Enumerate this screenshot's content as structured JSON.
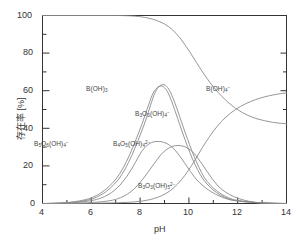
{
  "figure": {
    "name": "boron-speciation-diagram",
    "background_color": "#ffffff",
    "axis_color": "#333333",
    "curve_color": "#8a8a8a"
  },
  "axes": {
    "x_title": "pH",
    "y_title": "存在率 [%]",
    "x_ticks": [
      "4",
      "6",
      "8",
      "10",
      "12",
      "14"
    ],
    "y_ticks": [
      "0",
      "20",
      "40",
      "60",
      "80",
      "100"
    ],
    "x_minor_count": 1,
    "y_minor_count": 1
  },
  "species_labels": [
    {
      "id": "boric-acid",
      "html": "B(OH)<sub>3</sub>",
      "x": 86,
      "y": 85
    },
    {
      "id": "borate",
      "html": "B(OH)<sub>4</sub><sup>&#8722;</sup>",
      "x": 206,
      "y": 85
    },
    {
      "id": "triborate-mono",
      "html": "B<sub>3</sub>O<sub>3</sub>(OH)<sub>4</sub><sup>&#8722;</sup>",
      "x": 135,
      "y": 110
    },
    {
      "id": "pentaborate",
      "html": "B<sub>5</sub>O<sub>6</sub>(OH)<sub>4</sub><sup>&#8722;</sup>",
      "x": 34,
      "y": 140
    },
    {
      "id": "tetraborate",
      "html": "B<sub>4</sub>O<sub>5</sub>(OH)<sub>4</sub><sup>2&#8722;</sup>",
      "x": 113,
      "y": 140
    },
    {
      "id": "triborate-di",
      "html": "B<sub>3</sub>O<sub>3</sub>(OH)<sub>5</sub><sup>2&#8722;</sup>",
      "x": 138,
      "y": 182
    }
  ],
  "chart_data": {
    "type": "line",
    "title": "",
    "xlabel": "pH",
    "ylabel": "存在率 [%]",
    "xlim": [
      4,
      14
    ],
    "ylim": [
      0,
      100
    ],
    "xticks": [
      4,
      6,
      8,
      10,
      12,
      14
    ],
    "yticks": [
      0,
      20,
      40,
      60,
      80,
      100
    ],
    "grid": false,
    "legend": "inline-annotations",
    "x": [
      4.0,
      4.5,
      5.0,
      5.5,
      6.0,
      6.5,
      7.0,
      7.5,
      8.0,
      8.25,
      8.5,
      8.75,
      9.0,
      9.25,
      9.5,
      9.75,
      10.0,
      10.5,
      11.0,
      11.5,
      12.0,
      12.5,
      13.0,
      13.5,
      14.0
    ],
    "series": [
      {
        "name": "B(OH)3",
        "values": [
          100,
          100,
          100,
          99.8,
          99.5,
          99,
          98,
          96,
          92,
          89,
          85,
          80,
          73,
          65,
          56,
          46,
          37,
          21,
          11,
          5,
          2,
          1,
          0.4,
          0.1,
          0
        ]
      },
      {
        "name": "B(OH)4-",
        "values": [
          0,
          0,
          0,
          0.1,
          0.2,
          0.4,
          0.8,
          1.6,
          3.5,
          5.2,
          8,
          12,
          18,
          26,
          35,
          46,
          56,
          74,
          86,
          94,
          97.5,
          99,
          99.6,
          99.9,
          100
        ]
      },
      {
        "name": "B3O3(OH)4-",
        "values": [
          0,
          0.1,
          0.4,
          1.5,
          4,
          9,
          18,
          32,
          50,
          58,
          63,
          64,
          62,
          56,
          47,
          37,
          27,
          13,
          5,
          2,
          0.6,
          0.2,
          0.05,
          0,
          0
        ]
      },
      {
        "name": "B5O6(OH)4-",
        "values": [
          0,
          0.1,
          0.4,
          1.4,
          3.8,
          8.5,
          17,
          31,
          48,
          56,
          61,
          62,
          60,
          54,
          45,
          35,
          25,
          11,
          4,
          1.5,
          0.5,
          0.15,
          0.04,
          0,
          0
        ]
      },
      {
        "name": "B4O5(OH)4-2",
        "values": [
          0,
          0,
          0.1,
          0.3,
          1.0,
          2.8,
          7,
          14,
          24,
          28,
          30,
          30.5,
          30,
          28,
          24,
          20,
          15,
          7,
          2.5,
          1,
          0.3,
          0.1,
          0,
          0,
          0
        ]
      },
      {
        "name": "B3O3(OH)5-2",
        "values": [
          0,
          0,
          0,
          0,
          0.1,
          0.4,
          1.2,
          3,
          7,
          10,
          14,
          18,
          22,
          25,
          26,
          25,
          23,
          15,
          7,
          3,
          1,
          0.3,
          0.1,
          0,
          0
        ]
      }
    ]
  }
}
